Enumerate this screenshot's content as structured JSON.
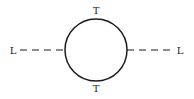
{
  "diagram": {
    "type": "feynman-loop",
    "labels": {
      "top": "T",
      "bottom": "T",
      "left": "L",
      "right": "L"
    },
    "loop": {
      "cx": 96,
      "cy": 50,
      "r": 31
    },
    "stroke_color": "#1a1a1a",
    "left_line": {
      "style": "dashed",
      "x1": 20,
      "x2": 65,
      "y": 50
    },
    "right_line": {
      "style": "dashed",
      "x1": 127,
      "x2": 173,
      "y": 50
    }
  }
}
